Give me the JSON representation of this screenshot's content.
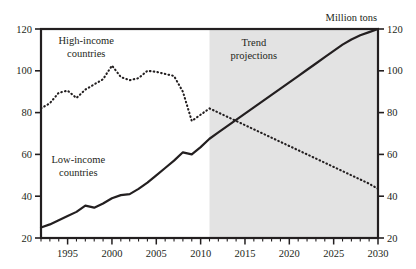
{
  "chart_data": {
    "type": "line",
    "title": "",
    "subtitle": "",
    "xlabel": "",
    "ylabel": "Million tons",
    "ylabel_position": "top-right",
    "xlim": [
      1992,
      2030
    ],
    "ylim": [
      20,
      120
    ],
    "grid": false,
    "legend": "none (inline annotations)",
    "y_ticks": [
      20,
      40,
      60,
      80,
      100,
      120
    ],
    "y_tick_labels": [
      "20",
      "40",
      "60",
      "80",
      "100",
      "120"
    ],
    "y_axis_left_labels": [
      "20",
      "40",
      "60",
      "80",
      "100",
      "120"
    ],
    "y_axis_right_labels": [
      "20",
      "40",
      "60",
      "80",
      "100",
      "120"
    ],
    "x_ticks_minor_every": 1,
    "x_tick_labels": [
      "1995",
      "2000",
      "2005",
      "2010",
      "2015",
      "2020",
      "2025",
      "2030"
    ],
    "x_tick_label_values": [
      1995,
      2000,
      2005,
      2010,
      2015,
      2020,
      2025,
      2030
    ],
    "shaded_region": {
      "label": "Trend projections",
      "x_start": 2011,
      "x_end": 2030,
      "color": "#e3e3e3"
    },
    "annotations": [
      {
        "name": "high-income-label",
        "text": "High-income\ncountries",
        "line1": "High-income",
        "line2": "countries",
        "x": 1997.1,
        "y": 113
      },
      {
        "name": "low-income-label",
        "text": "Low-income\ncountries",
        "line1": "Low-income",
        "line2": "countries",
        "x": 1996.2,
        "y": 56
      },
      {
        "name": "trend-projections-label",
        "text": "Trend\nprojections",
        "line1": "Trend",
        "line2": "projections",
        "x": 2016.0,
        "y": 112
      },
      {
        "name": "axis-unit-label",
        "text": "Million tons",
        "x": 2027.0,
        "y": 124
      }
    ],
    "series": [
      {
        "name": "Low-income countries",
        "style": "solid",
        "color": "#231f20",
        "x": [
          1992,
          1993,
          1994,
          1995,
          1996,
          1997,
          1998,
          1999,
          2000,
          2001,
          2002,
          2003,
          2004,
          2005,
          2006,
          2007,
          2008,
          2009,
          2010,
          2011,
          2012,
          2013,
          2014,
          2015,
          2016,
          2017,
          2018,
          2019,
          2020,
          2021,
          2022,
          2023,
          2024,
          2025,
          2026,
          2027,
          2028,
          2029,
          2030
        ],
        "values": [
          25,
          26.5,
          28.5,
          30.5,
          32.5,
          35.5,
          34.5,
          36.5,
          39,
          40.5,
          41,
          43.5,
          46.5,
          50,
          53.5,
          57,
          61,
          60,
          63.5,
          67.5,
          70.5,
          73.5,
          76.5,
          79.5,
          82.5,
          85.5,
          88.5,
          91.5,
          94.5,
          97.5,
          100.5,
          103.5,
          106.5,
          109.5,
          112.5,
          115,
          117,
          118.5,
          120
        ]
      },
      {
        "name": "High-income countries",
        "style": "dotted",
        "color": "#231f20",
        "x": [
          1992,
          1993,
          1994,
          1995,
          1996,
          1997,
          1998,
          1999,
          2000,
          2001,
          2002,
          2003,
          2004,
          2005,
          2006,
          2007,
          2008,
          2009,
          2010,
          2011,
          2012,
          2013,
          2014,
          2015,
          2016,
          2017,
          2018,
          2019,
          2020,
          2021,
          2022,
          2023,
          2024,
          2025,
          2026,
          2027,
          2028,
          2029,
          2030
        ],
        "values": [
          82,
          84.5,
          89.5,
          90.5,
          87,
          91,
          93.5,
          96,
          102.5,
          97,
          95.5,
          96.5,
          100,
          99.5,
          98.5,
          97.5,
          90,
          76,
          79,
          82,
          80,
          78,
          76,
          74,
          72,
          70,
          68,
          66,
          64,
          62,
          60,
          58,
          56,
          54,
          52,
          50,
          48,
          46,
          43.5
        ]
      }
    ]
  },
  "figure": {
    "background": "#ffffff",
    "frame_color": "#231f20",
    "shading_color": "#e3e3e3"
  }
}
